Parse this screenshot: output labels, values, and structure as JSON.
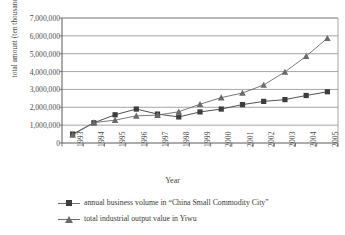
{
  "chart_data": {
    "type": "line",
    "title": "",
    "xlabel": "Year",
    "ylabel": "total amount (ten thousand Yuan)",
    "categories": [
      "1993",
      "1994",
      "1995",
      "1996",
      "1997",
      "1998",
      "1999",
      "2000",
      "2001",
      "2002",
      "2003",
      "2004",
      "2005"
    ],
    "x": [
      1993,
      1994,
      1995,
      1996,
      1997,
      1998,
      1999,
      2000,
      2001,
      2002,
      2003,
      2004,
      2005
    ],
    "ylim": [
      0,
      7000000
    ],
    "yticks": [
      0,
      1000000,
      2000000,
      3000000,
      4000000,
      5000000,
      6000000,
      7000000
    ],
    "ytick_labels": [
      "0",
      "1,000,000",
      "2,000,000",
      "3,000,000",
      "4,000,000",
      "5,000,000",
      "6,000,000",
      "7,000,000"
    ],
    "grid": true,
    "legend_position": "bottom-left",
    "series": [
      {
        "name": "annual business volume in  “China Small Commodity City”",
        "marker": "square",
        "color": "#3d3d3d",
        "values": [
          500000,
          1130000,
          1580000,
          1900000,
          1620000,
          1460000,
          1740000,
          1900000,
          2150000,
          2330000,
          2430000,
          2660000,
          2870000
        ]
      },
      {
        "name": "total industrial output value in Yiwu",
        "marker": "triangle",
        "color": "#6a6a6a",
        "values": [
          450000,
          1140000,
          1280000,
          1520000,
          1560000,
          1750000,
          2170000,
          2540000,
          2800000,
          3250000,
          3980000,
          4860000,
          5870000
        ]
      }
    ]
  },
  "axis": {
    "y_title": "total amount (ten thousand Yuan)",
    "x_title": "Year"
  },
  "legend": {
    "items": [
      {
        "label": "annual business volume in  “China Small Commodity City”",
        "marker": "square"
      },
      {
        "label": "total industrial output value in Yiwu",
        "marker": "triangle"
      }
    ]
  },
  "style": {
    "axis_color": "#5a5a5a",
    "grid_color": "#8f8f8f",
    "series1_color": "#3d3d3d",
    "series2_color": "#6a6a6a",
    "background": "#ffffff"
  }
}
